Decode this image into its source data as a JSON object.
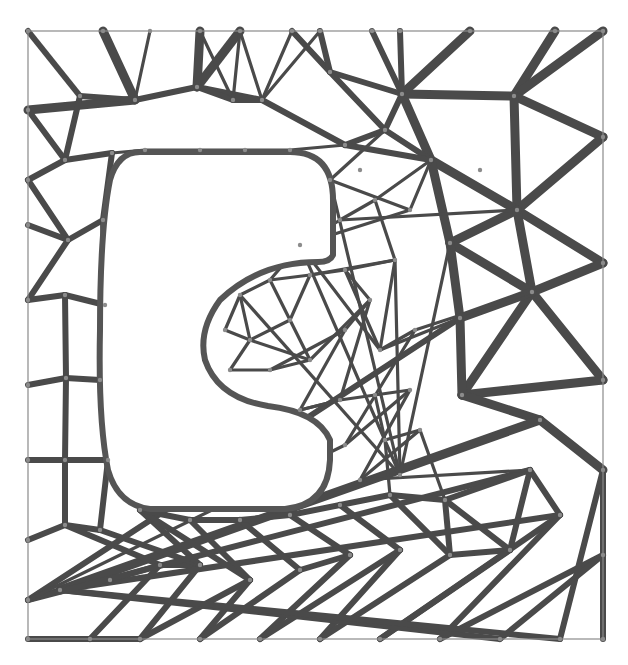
{
  "diagram": {
    "type": "triangulated-truss-mesh",
    "frame": {
      "x": 28,
      "y": 31,
      "width": 575,
      "height": 608,
      "stroke": "#8a8a8a"
    },
    "colors": {
      "strut": "#4a4a4a",
      "strut_light": "#6e6e6e",
      "hole_stroke": "#555555",
      "background": "#ffffff"
    },
    "hole": {
      "shape": "C-shaped cutout",
      "path": "M 140 152 L 290 152 Q 333 152 333 200 L 333 255 Q 330 262 318 262 Q 260 262 220 300 Q 198 330 205 360 Q 218 398 268 406 Q 318 412 330 440 L 330 460 Q 328 505 285 509 L 150 509 Q 118 505 108 470 Q 98 420 100 330 Q 100 230 110 180 Q 118 152 140 152 Z"
    },
    "nodes": [
      [
        28,
        31
      ],
      [
        103,
        31
      ],
      [
        150,
        31
      ],
      [
        200,
        31
      ],
      [
        240,
        31
      ],
      [
        292,
        31
      ],
      [
        320,
        31
      ],
      [
        372,
        31
      ],
      [
        400,
        31
      ],
      [
        470,
        31
      ],
      [
        555,
        31
      ],
      [
        603,
        31
      ],
      [
        28,
        110
      ],
      [
        80,
        96
      ],
      [
        135,
        100
      ],
      [
        197,
        87
      ],
      [
        233,
        100
      ],
      [
        262,
        100
      ],
      [
        330,
        72
      ],
      [
        402,
        94
      ],
      [
        514,
        96
      ],
      [
        603,
        137
      ],
      [
        28,
        180
      ],
      [
        65,
        160
      ],
      [
        112,
        153
      ],
      [
        145,
        150
      ],
      [
        200,
        150
      ],
      [
        245,
        150
      ],
      [
        290,
        150
      ],
      [
        345,
        145
      ],
      [
        385,
        130
      ],
      [
        431,
        160
      ],
      [
        480,
        170
      ],
      [
        28,
        225
      ],
      [
        68,
        240
      ],
      [
        103,
        220
      ],
      [
        517,
        210
      ],
      [
        603,
        263
      ],
      [
        28,
        300
      ],
      [
        65,
        295
      ],
      [
        105,
        305
      ],
      [
        450,
        243
      ],
      [
        532,
        292
      ],
      [
        460,
        318
      ],
      [
        28,
        385
      ],
      [
        66,
        378
      ],
      [
        100,
        380
      ],
      [
        603,
        380
      ],
      [
        28,
        460
      ],
      [
        65,
        460
      ],
      [
        108,
        460
      ],
      [
        462,
        395
      ],
      [
        540,
        420
      ],
      [
        603,
        470
      ],
      [
        28,
        540
      ],
      [
        65,
        525
      ],
      [
        100,
        530
      ],
      [
        140,
        510
      ],
      [
        190,
        520
      ],
      [
        240,
        520
      ],
      [
        290,
        515
      ],
      [
        340,
        505
      ],
      [
        390,
        495
      ],
      [
        445,
        500
      ],
      [
        530,
        470
      ],
      [
        28,
        600
      ],
      [
        60,
        590
      ],
      [
        110,
        580
      ],
      [
        160,
        565
      ],
      [
        200,
        565
      ],
      [
        250,
        580
      ],
      [
        300,
        570
      ],
      [
        350,
        555
      ],
      [
        400,
        550
      ],
      [
        450,
        555
      ],
      [
        510,
        550
      ],
      [
        560,
        515
      ],
      [
        603,
        555
      ],
      [
        28,
        639
      ],
      [
        90,
        639
      ],
      [
        140,
        639
      ],
      [
        200,
        639
      ],
      [
        260,
        639
      ],
      [
        320,
        639
      ],
      [
        380,
        639
      ],
      [
        440,
        639
      ],
      [
        500,
        639
      ],
      [
        560,
        639
      ],
      [
        603,
        639
      ],
      [
        240,
        295
      ],
      [
        270,
        280
      ],
      [
        310,
        275
      ],
      [
        290,
        320
      ],
      [
        250,
        340
      ],
      [
        225,
        330
      ],
      [
        230,
        370
      ],
      [
        270,
        370
      ],
      [
        310,
        360
      ],
      [
        345,
        330
      ],
      [
        370,
        300
      ],
      [
        345,
        270
      ],
      [
        395,
        260
      ],
      [
        380,
        350
      ],
      [
        415,
        330
      ],
      [
        300,
        410
      ],
      [
        340,
        400
      ],
      [
        375,
        395
      ],
      [
        410,
        390
      ],
      [
        345,
        445
      ],
      [
        385,
        440
      ],
      [
        420,
        430
      ],
      [
        360,
        480
      ],
      [
        400,
        475
      ],
      [
        300,
        245
      ],
      [
        340,
        220
      ],
      [
        375,
        200
      ],
      [
        410,
        210
      ],
      [
        330,
        180
      ],
      [
        360,
        170
      ]
    ],
    "edges": {
      "thick": [
        [
          1,
          14
        ],
        [
          14,
          12
        ],
        [
          3,
          15
        ],
        [
          15,
          4
        ],
        [
          9,
          19
        ],
        [
          19,
          20
        ],
        [
          10,
          20
        ],
        [
          20,
          11
        ],
        [
          20,
          21
        ],
        [
          20,
          36
        ],
        [
          19,
          31
        ],
        [
          31,
          36
        ],
        [
          36,
          21
        ],
        [
          36,
          37
        ],
        [
          36,
          42
        ],
        [
          42,
          37
        ],
        [
          42,
          47
        ],
        [
          42,
          51
        ],
        [
          51,
          47
        ],
        [
          51,
          52
        ],
        [
          52,
          53
        ],
        [
          52,
          66
        ],
        [
          31,
          41
        ],
        [
          41,
          36
        ],
        [
          41,
          42
        ],
        [
          41,
          43
        ],
        [
          43,
          51
        ],
        [
          43,
          42
        ]
      ],
      "medium": [
        [
          0,
          13
        ],
        [
          13,
          14
        ],
        [
          14,
          15
        ],
        [
          15,
          17
        ],
        [
          17,
          16
        ],
        [
          16,
          15
        ],
        [
          5,
          18
        ],
        [
          6,
          18
        ],
        [
          18,
          19
        ],
        [
          18,
          30
        ],
        [
          30,
          19
        ],
        [
          30,
          31
        ],
        [
          7,
          19
        ],
        [
          8,
          19
        ],
        [
          17,
          29
        ],
        [
          29,
          30
        ],
        [
          29,
          31
        ],
        [
          12,
          23
        ],
        [
          23,
          13
        ],
        [
          23,
          24
        ],
        [
          22,
          23
        ],
        [
          22,
          34
        ],
        [
          34,
          35
        ],
        [
          35,
          24
        ],
        [
          33,
          34
        ],
        [
          34,
          38
        ],
        [
          38,
          39
        ],
        [
          39,
          40
        ],
        [
          35,
          40
        ],
        [
          39,
          45
        ],
        [
          44,
          45
        ],
        [
          45,
          46
        ],
        [
          40,
          46
        ],
        [
          45,
          49
        ],
        [
          48,
          49
        ],
        [
          49,
          50
        ],
        [
          46,
          50
        ],
        [
          49,
          55
        ],
        [
          54,
          55
        ],
        [
          55,
          56
        ],
        [
          50,
          56
        ],
        [
          55,
          68
        ],
        [
          67,
          68
        ],
        [
          68,
          69
        ],
        [
          56,
          69
        ],
        [
          69,
          57
        ],
        [
          68,
          79
        ],
        [
          78,
          79
        ],
        [
          79,
          80
        ],
        [
          69,
          80
        ],
        [
          80,
          70
        ],
        [
          70,
          81
        ],
        [
          81,
          71
        ],
        [
          71,
          72
        ],
        [
          72,
          82
        ],
        [
          82,
          73
        ],
        [
          73,
          83
        ],
        [
          83,
          74
        ],
        [
          74,
          75
        ],
        [
          75,
          84
        ],
        [
          84,
          76
        ],
        [
          76,
          85
        ],
        [
          85,
          77
        ],
        [
          77,
          86
        ],
        [
          86,
          66
        ],
        [
          66,
          87
        ],
        [
          87,
          53
        ],
        [
          53,
          88
        ],
        [
          77,
          53
        ],
        [
          76,
          66
        ],
        [
          66,
          65
        ],
        [
          65,
          43
        ],
        [
          65,
          64
        ],
        [
          64,
          76
        ],
        [
          75,
          64
        ],
        [
          64,
          63
        ],
        [
          63,
          75
        ],
        [
          63,
          74
        ],
        [
          62,
          74
        ],
        [
          62,
          63
        ],
        [
          61,
          73
        ],
        [
          61,
          62
        ],
        [
          60,
          72
        ],
        [
          60,
          61
        ],
        [
          59,
          71
        ],
        [
          59,
          60
        ],
        [
          58,
          70
        ],
        [
          58,
          59
        ],
        [
          57,
          70
        ],
        [
          57,
          58
        ]
      ],
      "thin": [
        [
          26,
          27
        ],
        [
          27,
          28
        ],
        [
          28,
          29
        ],
        [
          25,
          26
        ],
        [
          2,
          14
        ],
        [
          3,
          16
        ],
        [
          4,
          16
        ],
        [
          4,
          17
        ],
        [
          5,
          17
        ],
        [
          6,
          17
        ],
        [
          24,
          25
        ],
        [
          89,
          90
        ],
        [
          90,
          91
        ],
        [
          91,
          92
        ],
        [
          92,
          93
        ],
        [
          93,
          94
        ],
        [
          94,
          89
        ],
        [
          89,
          93
        ],
        [
          90,
          92
        ],
        [
          93,
          95
        ],
        [
          95,
          96
        ],
        [
          96,
          97
        ],
        [
          97,
          93
        ],
        [
          96,
          98
        ],
        [
          98,
          99
        ],
        [
          99,
          97
        ],
        [
          97,
          92
        ],
        [
          98,
          104
        ],
        [
          104,
          105
        ],
        [
          105,
          99
        ],
        [
          99,
          100
        ],
        [
          100,
          101
        ],
        [
          101,
          91
        ],
        [
          100,
          91
        ],
        [
          102,
          101
        ],
        [
          102,
          100
        ],
        [
          103,
          102
        ],
        [
          103,
          42
        ],
        [
          101,
          112
        ],
        [
          112,
          113
        ],
        [
          113,
          114
        ],
        [
          114,
          115
        ],
        [
          115,
          101
        ],
        [
          113,
          102
        ],
        [
          102,
          43
        ],
        [
          104,
          105
        ],
        [
          105,
          106
        ],
        [
          106,
          107
        ],
        [
          107,
          108
        ],
        [
          108,
          103
        ],
        [
          106,
          109
        ],
        [
          109,
          110
        ],
        [
          110,
          111
        ],
        [
          111,
          107
        ],
        [
          109,
          62
        ],
        [
          110,
          63
        ],
        [
          111,
          64
        ],
        [
          108,
          65
        ],
        [
          112,
          41
        ],
        [
          114,
          36
        ],
        [
          115,
          31
        ],
        [
          116,
          117
        ],
        [
          117,
          112
        ],
        [
          113,
          116
        ],
        [
          116,
          31
        ],
        [
          117,
          30
        ],
        [
          89,
          112
        ],
        [
          90,
          113
        ]
      ]
    }
  }
}
